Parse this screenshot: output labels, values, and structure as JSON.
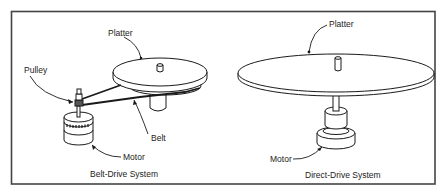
{
  "figure": {
    "panels": [
      {
        "id": "belt-drive",
        "caption": "Belt-Drive System",
        "labels": {
          "platter": "Platter",
          "pulley": "Pulley",
          "belt": "Belt",
          "motor": "Motor"
        }
      },
      {
        "id": "direct-drive",
        "caption": "Direct-Drive System",
        "labels": {
          "platter": "Platter",
          "motor": "Motor"
        }
      }
    ],
    "colors": {
      "stroke": "#1a1a1a",
      "frame": "#444444",
      "background": "#ffffff"
    }
  }
}
